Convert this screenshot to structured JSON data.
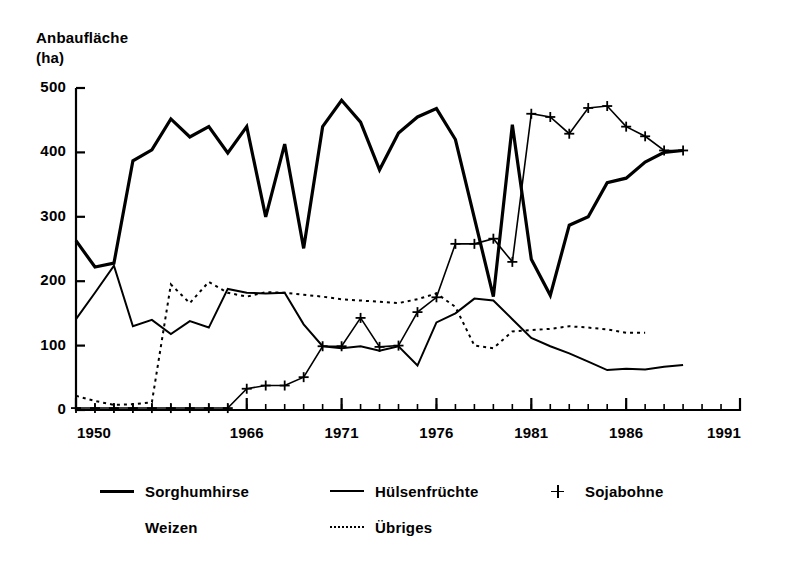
{
  "chart_data": {
    "type": "line",
    "title": "",
    "ylabel": "Anbaufläche (ha)",
    "ylabel_lines": [
      "Anbaufläche",
      "(ha)"
    ],
    "xlabel": "",
    "ylim": [
      0,
      500
    ],
    "yticks": [
      0,
      100,
      200,
      300,
      400,
      500
    ],
    "ytick_labels": [
      "0",
      "100",
      "200",
      "300",
      "400",
      "500"
    ],
    "xlim": [
      1950,
      1991
    ],
    "xticks": [
      1950,
      1966,
      1971,
      1976,
      1981,
      1986,
      1991
    ],
    "xtick_labels": [
      "1950",
      "1966",
      "1971",
      "1976",
      "1981",
      "1986",
      "1991"
    ],
    "grid": false,
    "legend_position": "below",
    "x": [
      1950,
      1951,
      1952,
      1953,
      1954,
      1955,
      1956,
      1957,
      1958,
      1966,
      1967,
      1968,
      1969,
      1970,
      1971,
      1972,
      1973,
      1974,
      1975,
      1976,
      1977,
      1978,
      1979,
      1980,
      1981,
      1982,
      1983,
      1984,
      1985,
      1986,
      1987,
      1988,
      1989,
      1990
    ],
    "series": [
      {
        "name": "Sorghumhirse",
        "style": "solid-thick",
        "values": [
          263,
          222,
          228,
          387,
          404,
          452,
          424,
          440,
          399,
          440,
          300,
          413,
          251,
          440,
          481,
          447,
          373,
          430,
          455,
          468,
          420,
          298,
          176,
          443,
          234,
          178,
          287,
          300,
          353,
          360,
          385,
          400,
          403,
          null
        ]
      },
      {
        "name": "Weizen",
        "style": "solid-medium",
        "values": [
          141,
          182,
          224,
          130,
          140,
          118,
          138,
          128,
          188,
          182,
          181,
          182,
          133,
          99,
          96,
          99,
          92,
          99,
          69,
          136,
          150,
          173,
          170,
          141,
          112,
          99,
          88,
          75,
          62,
          64,
          63,
          67,
          70,
          null
        ]
      },
      {
        "name": "Sojabohne",
        "style": "plus-marker",
        "values": [
          3,
          3,
          3,
          3,
          3,
          3,
          3,
          3,
          3,
          33,
          38,
          38,
          51,
          99,
          99,
          143,
          98,
          100,
          152,
          175,
          258,
          258,
          266,
          230,
          460,
          455,
          429,
          469,
          472,
          440,
          425,
          403,
          403,
          null
        ]
      },
      {
        "name": "Übriges",
        "style": "dotted",
        "values": [
          22,
          14,
          8,
          9,
          12,
          195,
          166,
          199,
          182,
          176,
          183,
          182,
          179,
          176,
          172,
          170,
          168,
          166,
          172,
          181,
          160,
          100,
          96,
          122,
          124,
          126,
          130,
          128,
          125,
          120,
          120,
          null,
          null,
          null
        ]
      }
    ],
    "legend": [
      {
        "label": "Sorghumhirse",
        "style": "solid-thick",
        "row": 0,
        "col": 0
      },
      {
        "label": "Hülsenfrüchte",
        "style": "solid-thin",
        "row": 0,
        "col": 1
      },
      {
        "label": "Sojabohne",
        "style": "plus-marker",
        "row": 0,
        "col": 2
      },
      {
        "label": "Weizen",
        "style": "none",
        "row": 1,
        "col": 0
      },
      {
        "label": "Übriges",
        "style": "dotted",
        "row": 1,
        "col": 1
      }
    ],
    "colors": {
      "ink": "#000000",
      "background": "#ffffff"
    }
  }
}
